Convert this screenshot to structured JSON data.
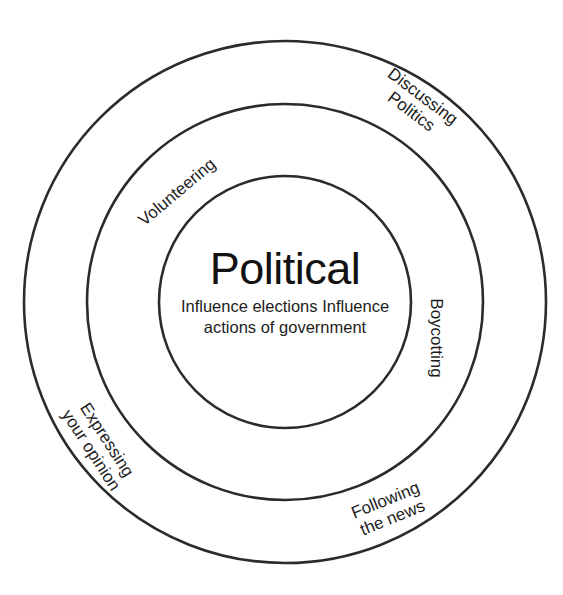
{
  "figure": {
    "kind": "concentric-circles-diagram",
    "background_color": "#ffffff",
    "stroke_color": "#2b2b2b",
    "text_color": "#1d1d1d"
  },
  "core": {
    "title": "Political",
    "sub_line_1": "Influence elections",
    "sub_line_2": "Influence actions of",
    "sub_line_3": "government"
  },
  "rings": [
    {
      "name": "inner-circle",
      "center_x": 285,
      "center_y": 302,
      "radius": 126,
      "stroke_width": 2.6
    },
    {
      "name": "middle-ring",
      "center_x": 285,
      "center_y": 302,
      "radius": 198,
      "stroke_width": 2.6
    },
    {
      "name": "outer-ring",
      "center_x": 285,
      "center_y": 302,
      "radius": 261,
      "stroke_width": 2.6
    }
  ],
  "labels": {
    "discussing_politics": {
      "line_1": "Discussing",
      "line_2": "Politics",
      "ring": "outer-ring",
      "rotation_deg": 37
    },
    "volunteering": {
      "line_1": "Volunteering",
      "ring": "middle-ring",
      "rotation_deg": -40
    },
    "boycotting": {
      "line_1": "Boycotting",
      "ring": "middle-ring",
      "rotation_deg": 90
    },
    "expressing_your_opinion": {
      "line_1": "Expressing",
      "line_2": "your opinion",
      "ring": "outer-ring",
      "rotation_deg": 57
    },
    "following_the_news": {
      "line_1": "Following",
      "line_2": "the news",
      "ring": "outer-ring",
      "rotation_deg": -22
    }
  }
}
